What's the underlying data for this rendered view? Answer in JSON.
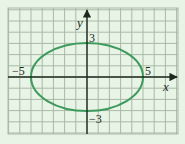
{
  "chart_data": {
    "type": "line",
    "title": "",
    "xlabel": "x",
    "ylabel": "y",
    "xlim": [
      -7,
      8
    ],
    "ylim": [
      -5,
      6
    ],
    "grid": true,
    "grid_step": 1,
    "series": [
      {
        "name": "ellipse",
        "shape": "ellipse",
        "center": [
          0,
          0
        ],
        "semi_major_x": 5,
        "semi_minor_y": 3,
        "color": "#3d9a5c",
        "key_points": [
          [
            -5,
            0
          ],
          [
            5,
            0
          ],
          [
            0,
            3
          ],
          [
            0,
            -3
          ]
        ]
      }
    ],
    "annotations": [
      {
        "text": "−5",
        "at": [
          -5,
          0
        ]
      },
      {
        "text": "5",
        "at": [
          5,
          0
        ]
      },
      {
        "text": "3",
        "at": [
          0,
          3
        ]
      },
      {
        "text": "−3",
        "at": [
          0,
          -3
        ]
      }
    ]
  },
  "labels": {
    "x_axis": "x",
    "y_axis": "y",
    "x_neg": "−5",
    "x_pos": "5",
    "y_pos": "3",
    "y_neg": "−3"
  },
  "colors": {
    "background": "#e8f4e6",
    "grid": "#a9b9a7",
    "axis": "#1f2a1f",
    "curve": "#3d9a5c"
  }
}
